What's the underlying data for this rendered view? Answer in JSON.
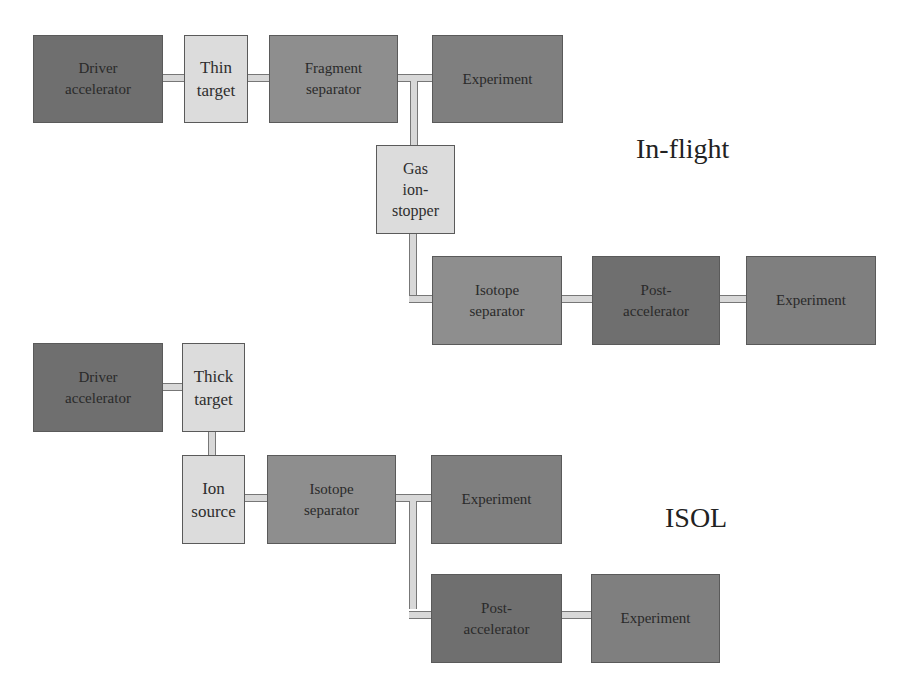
{
  "in_flight": {
    "title": "In-flight",
    "driver_accelerator": {
      "line1": "Driver",
      "line2": "accelerator"
    },
    "thin_target": {
      "line1": "Thin",
      "line2": "target"
    },
    "fragment_separator": {
      "line1": "Fragment",
      "line2": "separator"
    },
    "experiment_1": {
      "line1": "Experiment"
    },
    "gas_ion_stopper": {
      "line1": "Gas",
      "line2": "ion-",
      "line3": "stopper"
    },
    "isotope_separator": {
      "line1": "Isotope",
      "line2": "separator"
    },
    "post_accelerator": {
      "line1": "Post-",
      "line2": "accelerator"
    },
    "experiment_2": {
      "line1": "Experiment"
    }
  },
  "isol": {
    "title": "ISOL",
    "driver_accelerator": {
      "line1": "Driver",
      "line2": "accelerator"
    },
    "thick_target": {
      "line1": "Thick",
      "line2": "target"
    },
    "ion_source": {
      "line1": "Ion",
      "line2": "source"
    },
    "isotope_separator": {
      "line1": "Isotope",
      "line2": "separator"
    },
    "experiment_1": {
      "line1": "Experiment"
    },
    "post_accelerator": {
      "line1": "Post-",
      "line2": "accelerator"
    },
    "experiment_2": {
      "line1": "Experiment"
    }
  },
  "colors": {
    "accelerator": "#6f6f6f",
    "separator": "#8e8e8e",
    "experiment": "#7f7f7f",
    "target": "#dcdcdc",
    "pipe": "#d8d8d8"
  }
}
